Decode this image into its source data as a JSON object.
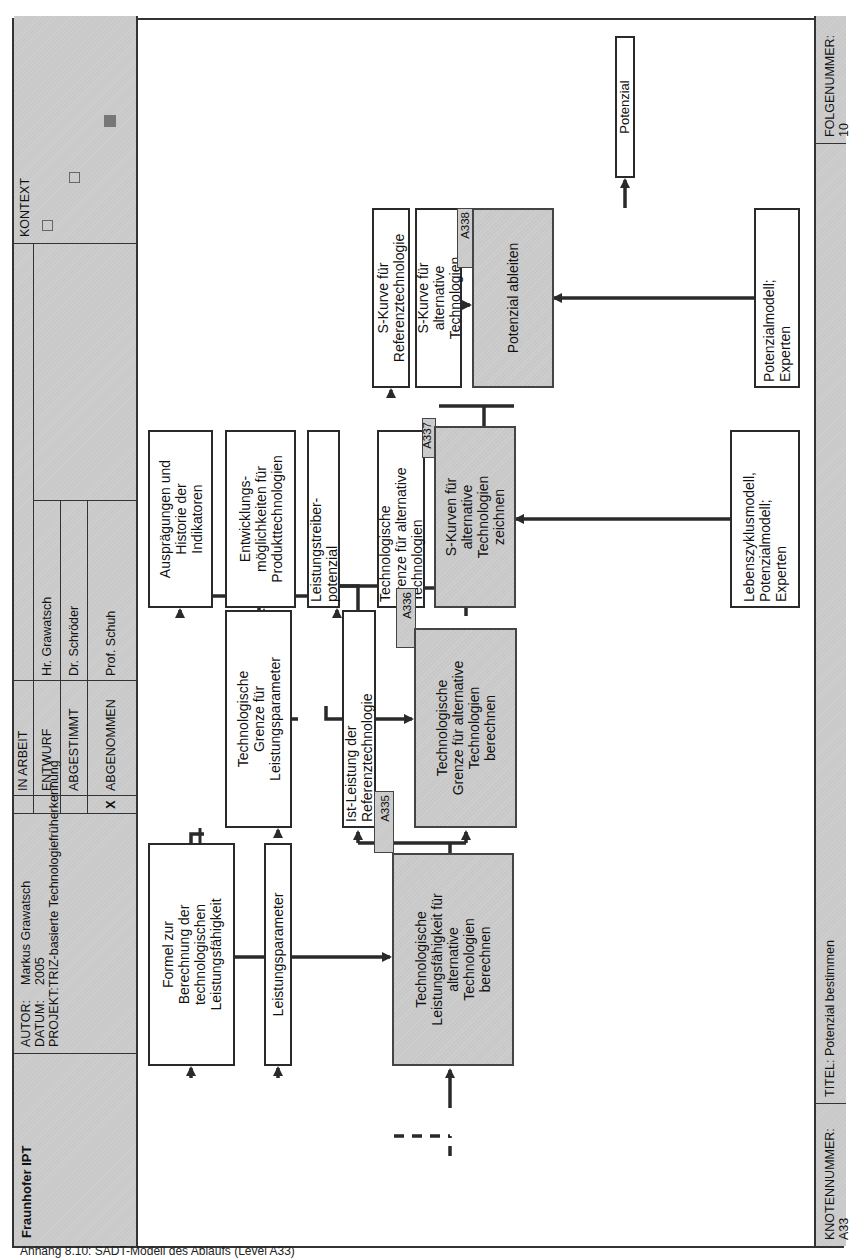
{
  "header": {
    "organization": "Fraunhofer IPT",
    "author_label": "AUTOR:",
    "author": "Markus Grawatsch",
    "date_label": "DATUM:",
    "date": "2005",
    "project_label": "PROJEKT:",
    "project": "TRIZ-basierte Technologiefrüherkennung",
    "status_rows": [
      {
        "mark": "",
        "status": "IN ARBEIT",
        "person": ""
      },
      {
        "mark": "",
        "status": "ENTWURF",
        "person": "Hr. Grawatsch"
      },
      {
        "mark": "",
        "status": "ABGESTIMMT",
        "person": "Dr. Schröder"
      },
      {
        "mark": "X",
        "status": "ABGENOMMEN",
        "person": "Prof. Schuh"
      }
    ],
    "context_label": "KONTEXT"
  },
  "footer": {
    "node_number": "KNOTENNUMMER: A33",
    "title": "TITEL: Potenzial bestimmen",
    "sequence_number": "FOLGENUMMER: 10"
  },
  "activities": [
    {
      "id": "A335",
      "label": "Technologische\nLeistungsfähigkeit für\nalternative\nTechnologien\nberechnen"
    },
    {
      "id": "A336",
      "label": "Technologische\nGrenze für alternative\nTechnologien\nberechnen"
    },
    {
      "id": "A337",
      "label": "S-Kurven für\nalternative\nTechnologien\nzeichnen"
    },
    {
      "id": "A338",
      "label": "Potenzial ableiten"
    }
  ],
  "data_boxes": {
    "formel": "Formel zur\nBerechnung der\ntechnologischen\nLeistungsfähigkeit",
    "leistungsparameter": "Leistungsparameter",
    "grenze_leistungsparameter": "Technologische\nGrenze für\nLeistungsparameter",
    "ist_leistung": "Ist-Leistung der\nReferenztechnologie",
    "auspraegungen": "Ausprägungen und\nHistorie der\nIndikatoren",
    "entwicklung": "Entwicklungs-\nmöglichkeiten für\nProdukttechnologien",
    "leistungstreiber": "Leistungstreiber-\npotenzial",
    "grenze_alternative": "Technologische\nGrenze für alternative\nTechnologien",
    "lebenszyklus": "Lebenszyklusmodell,\nPotenzialmodell;\nExperten",
    "skurve_referenz": "S-Kurve für\nReferenztechnologie",
    "skurve_alternative": "S-Kurve für\nalternative\nTechnologien",
    "potenzialmodell": "Potenzialmodell;\nExperten",
    "potenzial": "Potenzial"
  },
  "caption": "Anhang 8.10: SADT-Modell des Ablaufs (Level A33)"
}
